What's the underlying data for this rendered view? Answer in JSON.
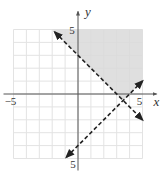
{
  "chart_data": {
    "type": "line",
    "title": "",
    "xlabel": "x",
    "ylabel": "y",
    "xlim": [
      -5,
      5
    ],
    "ylim": [
      -5,
      5
    ],
    "grid": true,
    "tick_labels": {
      "x_min": "−5",
      "x_max": "5",
      "y_max": "5",
      "y_min": "5"
    },
    "series": [
      {
        "name": "boundary-1",
        "equation": "y = -x + 3",
        "style": "dashed",
        "from": [
          -1.8,
          4.8
        ],
        "to": [
          5,
          -2
        ]
      },
      {
        "name": "boundary-2",
        "equation": "y = x - 4",
        "style": "dashed",
        "from": [
          -0.9,
          -4.9
        ],
        "to": [
          5,
          1
        ]
      }
    ],
    "shaded_region": {
      "description": "y > -x + 3 and y > x - 4",
      "vertices": [
        [
          -2,
          5
        ],
        [
          5,
          5
        ],
        [
          5,
          1
        ],
        [
          3.5,
          -0.5
        ]
      ],
      "color": "#d9d9d9"
    },
    "intersection": [
      3.5,
      -0.5
    ]
  },
  "colors": {
    "grid": "#e3e3e3",
    "axis": "#555555",
    "line": "#222222",
    "shade": "#d9d9d9"
  }
}
